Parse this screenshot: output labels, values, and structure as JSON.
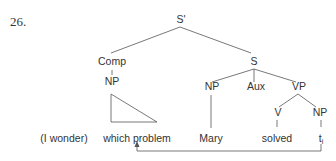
{
  "example_number": "26.",
  "tree": {
    "root": "S'",
    "comp": "Comp",
    "comp_np": "NP",
    "s": "S",
    "s_np": "NP",
    "aux": "Aux",
    "vp": "VP",
    "v": "V",
    "vp_np": "NP"
  },
  "terminals": {
    "prefix": "(I wonder)",
    "wh_phrase": "which problem",
    "subject": "Mary",
    "verb": "solved",
    "trace": "t",
    "trace_index": "i"
  },
  "colors": {
    "line": "#555555",
    "text": "#333333"
  }
}
